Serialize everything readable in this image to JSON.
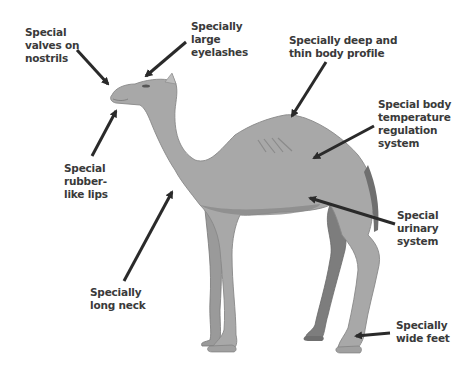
{
  "diagram": {
    "labels": [
      {
        "id": "nostrils",
        "text": "Special\nvalves on\nnostrils"
      },
      {
        "id": "eyelashes",
        "text": "Specially\nlarge\neyelashes"
      },
      {
        "id": "body-profile",
        "text": "Specially deep and\nthin body profile"
      },
      {
        "id": "temperature",
        "text": "Special body\ntemperature\nregulation\nsystem"
      },
      {
        "id": "lips",
        "text": "Special\nrubber-\nlike lips"
      },
      {
        "id": "urinary",
        "text": "Special\nurinary\nsystem"
      },
      {
        "id": "neck",
        "text": "Specially\nlong neck"
      },
      {
        "id": "feet",
        "text": "Specially\nwide feet"
      }
    ],
    "colors": {
      "camel_body": "#a8a8a8",
      "camel_shadow": "#8a8a8a",
      "camel_dark_leg": "#7d7d7d",
      "arrow": "#2a2a2a",
      "text": "#3a3a3a",
      "background": "#ffffff"
    }
  }
}
